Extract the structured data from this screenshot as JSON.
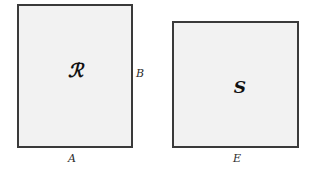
{
  "figure": {
    "background_color": "#ffffff",
    "shape_fill_color": "#f2f2f2",
    "shape_stroke_color": "#3a3a3a",
    "label_color": "#111111",
    "shapes": [
      {
        "name": "rectangle-r",
        "interior_label": "ℛ",
        "bottom_label": "A",
        "right_label": "B"
      },
      {
        "name": "rectangle-s",
        "interior_label": "S",
        "bottom_label": "E",
        "right_label": ""
      }
    ],
    "labels": {
      "region_r": "ℛ",
      "region_s": "S",
      "side_a": "A",
      "side_b": "B",
      "side_e": "E"
    }
  }
}
